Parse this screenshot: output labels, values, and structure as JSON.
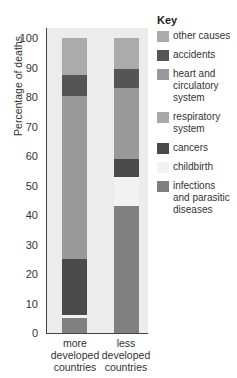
{
  "chart_data": {
    "type": "bar",
    "stacked": true,
    "title": "",
    "xlabel": "",
    "ylabel": "Percentage of deaths",
    "ylim": [
      0,
      100
    ],
    "yticks": [
      0,
      10,
      20,
      30,
      40,
      50,
      60,
      70,
      80,
      90,
      100
    ],
    "categories": [
      "more developed countries",
      "less developed countries"
    ],
    "category_lines": [
      [
        "more",
        "developed",
        "countries"
      ],
      [
        "less",
        "developed",
        "countries"
      ]
    ],
    "legend_title": "Key",
    "legend_position": "right",
    "series": [
      {
        "name": "infections and parasitic diseases",
        "color": "#808080",
        "values": [
          5,
          43
        ]
      },
      {
        "name": "childbirth",
        "color": "#f2f2f2",
        "values": [
          1,
          10
        ]
      },
      {
        "name": "cancers",
        "color": "#4a4a4a",
        "values": [
          19,
          6
        ]
      },
      {
        "name": "respiratory system",
        "color": "#a8a8a8",
        "values": [
          0,
          0
        ]
      },
      {
        "name": "heart and circulatory system",
        "color": "#999999",
        "values": [
          55.5,
          24
        ]
      },
      {
        "name": "accidents",
        "color": "#555555",
        "values": [
          7,
          6.5
        ]
      },
      {
        "name": "other causes",
        "color": "#ababab",
        "values": [
          12.5,
          10.5
        ]
      }
    ]
  },
  "key": {
    "title": "Key",
    "items": [
      {
        "label": "other causes",
        "lines": [
          "other causes"
        ],
        "color": "#ababab"
      },
      {
        "label": "accidents",
        "lines": [
          "accidents"
        ],
        "color": "#555555"
      },
      {
        "label": "heart and circulatory system",
        "lines": [
          "heart and",
          "circulatory",
          "system"
        ],
        "color": "#999999"
      },
      {
        "label": "respiratory system",
        "lines": [
          "respiratory",
          "system"
        ],
        "color": "#a8a8a8"
      },
      {
        "label": "cancers",
        "lines": [
          "cancers"
        ],
        "color": "#4a4a4a"
      },
      {
        "label": "childbirth",
        "lines": [
          "childbirth"
        ],
        "color": "#f2f2f2"
      },
      {
        "label": "infections and parasitic diseases",
        "lines": [
          "infections",
          "and parasitic",
          "diseases"
        ],
        "color": "#808080"
      }
    ]
  }
}
